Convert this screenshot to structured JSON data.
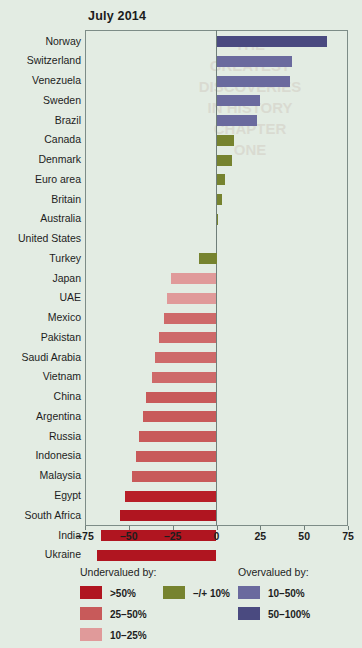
{
  "chart_data": {
    "type": "bar",
    "orientation": "horizontal",
    "title": "July 2014",
    "xlabel": "",
    "ylabel": "",
    "xlim": [
      -75,
      75
    ],
    "xticks": [
      -75,
      -50,
      -25,
      0,
      25,
      50,
      75
    ],
    "xticklabels": [
      "–75",
      "–50",
      "–25",
      "0",
      "25",
      "50",
      "75"
    ],
    "grid": false,
    "legend_position": "bottom",
    "categories": [
      "Norway",
      "Switzerland",
      "Venezuela",
      "Sweden",
      "Brazil",
      "Canada",
      "Denmark",
      "Euro area",
      "Britain",
      "Australia",
      "United States",
      "Turkey",
      "Japan",
      "UAE",
      "Mexico",
      "Pakistan",
      "Saudi Arabia",
      "Vietnam",
      "China",
      "Argentina",
      "Russia",
      "Indonesia",
      "Malaysia",
      "Egypt",
      "South Africa",
      "India",
      "Ukraine"
    ],
    "values": [
      63,
      43,
      42,
      25,
      23,
      10,
      9,
      5,
      3,
      1,
      0,
      -10,
      -26,
      -28,
      -30,
      -33,
      -35,
      -37,
      -40,
      -42,
      -44,
      -46,
      -48,
      -52,
      -55,
      -66,
      -68
    ],
    "bar_colors": [
      "#4a4a80",
      "#6a6a9e",
      "#6a6a9e",
      "#6a6a9e",
      "#6a6a9e",
      "#76832f",
      "#76832f",
      "#76832f",
      "#76832f",
      "#76832f",
      "#76832f",
      "#76832f",
      "#e09a9a",
      "#e09a9a",
      "#ce6a6a",
      "#ce6a6a",
      "#ce6a6a",
      "#ce6a6a",
      "#c85a5a",
      "#c85a5a",
      "#c85a5a",
      "#c85a5a",
      "#c85a5a",
      "#b81f28",
      "#b01520",
      "#b01520",
      "#b01520"
    ],
    "ghost_lines": [
      "THE",
      "GREATEST",
      "DISCOVERIES",
      "IN HISTORY",
      "CHAPTER",
      "ONE"
    ]
  },
  "legend": {
    "undervalued_title": "Undervalued by:",
    "overvalued_title": "Overvalued by:",
    "undervalued_items": [
      {
        "label": ">50%",
        "color": "#b01520"
      },
      {
        "label": "25–50%",
        "color": "#c85a5a"
      },
      {
        "label": "10–25%",
        "color": "#e09a9a"
      }
    ],
    "neutral_item": {
      "label": "–/+ 10%",
      "color": "#76832f"
    },
    "overvalued_items": [
      {
        "label": "10–50%",
        "color": "#6a6a9e"
      },
      {
        "label": "50–100%",
        "color": "#4a4a80"
      }
    ]
  },
  "colors": {
    "background": "#e3ece3",
    "frame": "#7d8c87",
    "text": "#1d1d1d"
  }
}
